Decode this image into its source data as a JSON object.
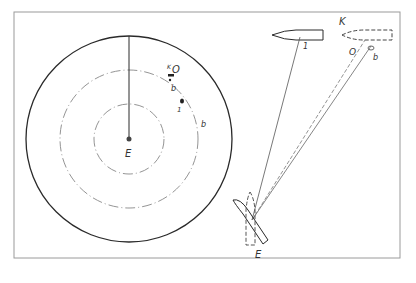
{
  "diagram": {
    "type": "radar-plot-and-ship-geometry",
    "colors": {
      "line": "#2a2a2a",
      "frame": "#9a9a9a",
      "thin": "#777777"
    },
    "radar_panel": {
      "center_label": "E",
      "rings": [
        "outer",
        "middle",
        "inner"
      ],
      "echo_labels": {
        "k": "K",
        "o": "O",
        "b1": "b",
        "one": "1",
        "b2": "b"
      }
    },
    "geometry_panel": {
      "ship_1_label": "1",
      "ship_k_label": "K",
      "bearing_o_label": "O",
      "bearing_b_label": "b",
      "own_ship_label": "E"
    }
  }
}
